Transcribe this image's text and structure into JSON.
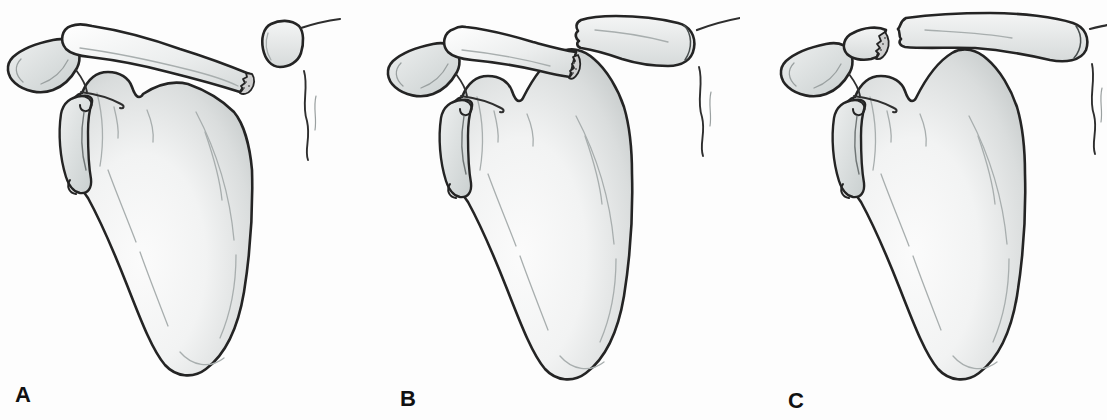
{
  "figure": {
    "description_icons": [
      "scapula",
      "glenoid",
      "acromion",
      "coracoid-process",
      "clavicle",
      "fracture-surface",
      "sternum-outline"
    ],
    "panels": [
      {
        "label": "A",
        "fracture_site": "clavicle-near-sternal-end"
      },
      {
        "label": "B",
        "fracture_site": "clavicle-midshaft"
      },
      {
        "label": "C",
        "fracture_site": "clavicle-near-acromial-end"
      }
    ],
    "colors": {
      "background": "#fdfdfd",
      "outline": "#242424",
      "bone_highlight": "#fbfbfb",
      "bone_shade": "#c2c7c7",
      "fracture_surface": "#cfcfcf",
      "label": "#111111"
    }
  }
}
